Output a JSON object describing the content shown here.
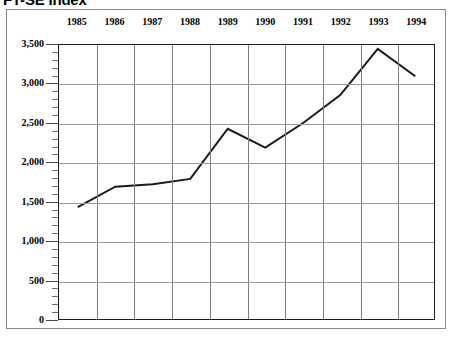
{
  "chart_data": {
    "type": "line",
    "title": "FT-SE Index",
    "xlabel": "",
    "ylabel": "",
    "x": [
      "1985",
      "1986",
      "1987",
      "1988",
      "1989",
      "1990",
      "1991",
      "1992",
      "1993",
      "1994"
    ],
    "categories": [
      "1985",
      "1986",
      "1987",
      "1988",
      "1989",
      "1990",
      "1991",
      "1992",
      "1993",
      "1994"
    ],
    "values": [
      1430,
      1690,
      1720,
      1790,
      2430,
      2190,
      2500,
      2860,
      3450,
      3100
    ],
    "series": [
      {
        "name": "FT-SE Index",
        "values": [
          1430,
          1690,
          1720,
          1790,
          2430,
          2190,
          2500,
          2860,
          3450,
          3100
        ]
      }
    ],
    "ylim": [
      0,
      3500
    ],
    "ytick_labels": [
      "0",
      "500",
      "1,000",
      "1,500",
      "2,000",
      "2,500",
      "3,000",
      "3,500"
    ],
    "ytick_values": [
      0,
      500,
      1000,
      1500,
      2000,
      2500,
      3000,
      3500
    ],
    "y_minor_step": 100,
    "grid": true,
    "grid_axes": "both",
    "legend": "none",
    "legend_position": "none",
    "xtick_labels_position": "top",
    "line_color": "#1a1a1a",
    "grid_color": "#9a9a9a",
    "axis_color": "#1a1a1a",
    "background_color": "#ffffff",
    "frame_color": "#8a8a8a",
    "markers": "none"
  }
}
